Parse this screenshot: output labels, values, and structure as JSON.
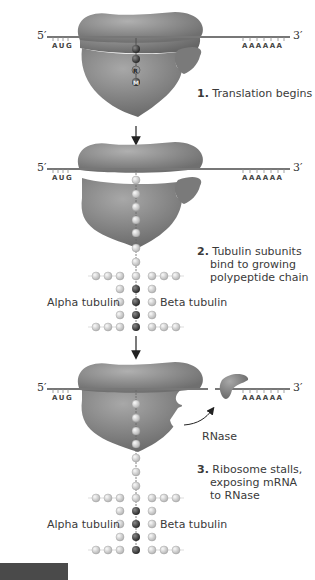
{
  "diagram": {
    "mrna": {
      "five_prime": "5′",
      "three_prime": "3′",
      "start_codon": "AUG",
      "poly_a": "AAAAAA"
    },
    "steps": [
      {
        "number": "1.",
        "lines": [
          "Translation begins"
        ]
      },
      {
        "number": "2.",
        "lines": [
          "Tubulin subunits",
          "bind to growing",
          "polypeptide chain"
        ]
      },
      {
        "number": "3.",
        "lines": [
          "Ribosome stalls,",
          "exposing mRNA",
          "to RNase"
        ]
      }
    ],
    "labels": {
      "alpha": "Alpha tubulin",
      "beta": "Beta tubulin",
      "rnase": "RNase"
    },
    "peptide_residues": [
      "M",
      "R",
      "E",
      "I"
    ],
    "colors": {
      "ribosome": "#8a8a8a",
      "ribosome_dark": "#5e5e5e",
      "bead": "#d6d6d6",
      "dark_bead": "#3a3a3a",
      "mrna": "#777777"
    }
  }
}
